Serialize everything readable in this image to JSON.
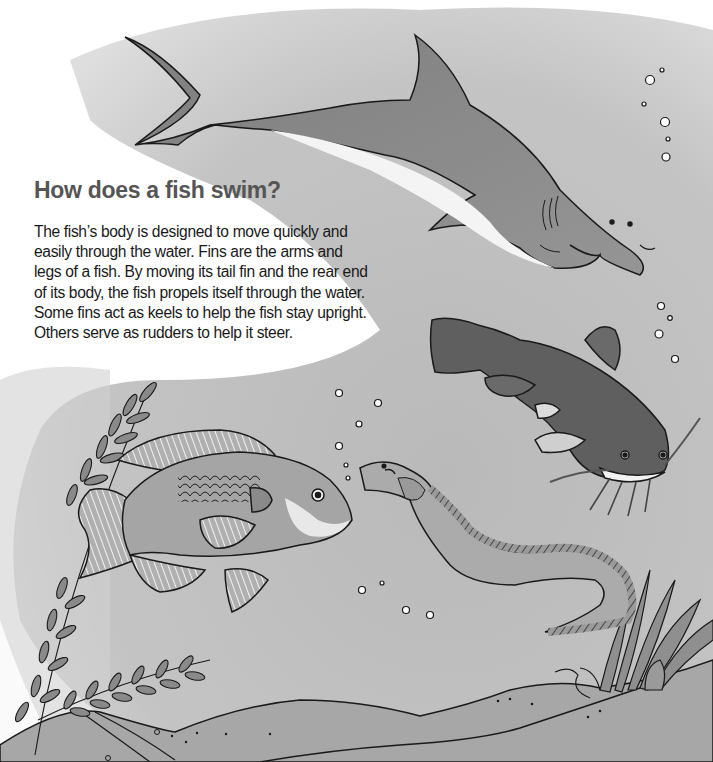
{
  "page": {
    "heading": "How does a fish swim?",
    "paragraph_lines": [
      "The fish’s body is designed to move quickly and",
      "easily through the water. Fins are the arms and",
      "legs of a fish. By moving its tail fin and the rear end",
      "of its body, the fish propels itself through the water.",
      "Some fins act as keels to help the fish stay upright.",
      "Others serve as rudders to help it steer."
    ]
  },
  "illustration": {
    "subjects": [
      "shark",
      "catfish",
      "sunfish",
      "eel",
      "seaweed",
      "sea-floor",
      "bubbles"
    ],
    "colors": {
      "water": "#bdbdbd",
      "water_light": "#d9d9d9",
      "shark": "#8c8c8c",
      "catfish": "#5e5e5e",
      "sunfish": "#a6a6a6",
      "eel": "#a9a9a9",
      "seaweed": "#8a8a8a",
      "floor": "#a3a3a3",
      "outline": "#1a1a1a"
    }
  }
}
